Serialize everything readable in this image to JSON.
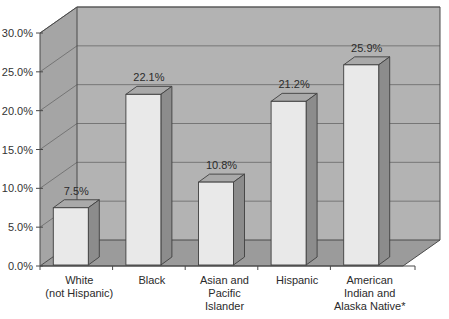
{
  "chart_data": {
    "type": "bar",
    "title": "",
    "subtitle": "",
    "xlabel": "",
    "ylabel": "",
    "categories": [
      "White\n(not Hispanic)",
      "Black",
      "Asian and\nPacific\nIslander",
      "Hispanic",
      "American\nIndian and\nAlaska Native*"
    ],
    "category_lines": [
      [
        "White",
        "(not Hispanic)"
      ],
      [
        "Black"
      ],
      [
        "Asian and",
        "Pacific",
        "Islander"
      ],
      [
        "Hispanic"
      ],
      [
        "American",
        "Indian and",
        "Alaska Native*"
      ]
    ],
    "values": [
      7.5,
      22.1,
      10.8,
      21.2,
      25.9
    ],
    "data_labels": [
      "7.5%",
      "22.1%",
      "10.8%",
      "21.2%",
      "25.9%"
    ],
    "ylim": [
      0,
      30
    ],
    "ytick_values": [
      0,
      5,
      10,
      15,
      20,
      25,
      30
    ],
    "ytick_labels": [
      "0.0%",
      "5.0%",
      "10.0%",
      "15.0%",
      "20.0%",
      "25.0%",
      "30.0%"
    ],
    "grid": true,
    "grid_axis": "y",
    "legend": false,
    "legend_position": "none",
    "three_d": true,
    "annotations": [
      "*"
    ],
    "colors": {
      "bar_front": "#e9e9e9",
      "bar_side": "#8c8c8c",
      "bar_top": "#a9a9a9",
      "wall_back": "#b3b3b3",
      "wall_left": "#a5a5a5",
      "floor": "#9b9b9b",
      "gridline": "#6f6f6f",
      "axis": "#4a4a4a",
      "text": "#2b2b2b"
    }
  }
}
